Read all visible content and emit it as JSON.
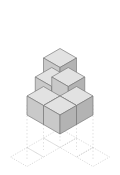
{
  "figure": {
    "title": "Isometric cube stack with projected base grid",
    "type": "isometric-block-diagram",
    "background_color": "#ffffff",
    "canvas": {
      "width": 120,
      "height": 175
    }
  },
  "style": {
    "cube_top_fill": "#e2e2e2",
    "cube_left_fill": "#c9c9c9",
    "cube_right_fill": "#b3b3b3",
    "cube_stroke": "#7a7a7a",
    "cube_stroke_width": 0.7,
    "grid_stroke": "#c0c0c0",
    "grid_stroke_width": 0.6,
    "drop_line_stroke": "#cfcfcf",
    "drop_line_width": 0.6,
    "drop_line_dash": "1.5 2"
  },
  "geometry": {
    "tile_half_width": 16.5,
    "tile_half_height": 9.5,
    "cube_height": 19,
    "origin_x": 60,
    "origin_y": 96,
    "grid_origin_x": 60,
    "grid_origin_y": 150
  },
  "cubes": [
    {
      "id": "cube-front-left",
      "label": "Front left cube",
      "col": -1,
      "row": 0,
      "layer": 0
    },
    {
      "id": "cube-front-center",
      "label": "Front center cube",
      "col": 0,
      "row": 1,
      "layer": 0
    },
    {
      "id": "cube-front-right",
      "label": "Front right cube",
      "col": 1,
      "row": 0,
      "layer": 0
    },
    {
      "id": "cube-mid-left",
      "label": "Middle left cube",
      "col": -0.5,
      "row": 0,
      "layer": 1
    },
    {
      "id": "cube-mid-right",
      "label": "Middle right cube",
      "col": 0.5,
      "row": 0,
      "layer": 1
    },
    {
      "id": "cube-top",
      "label": "Top cube",
      "col": 0,
      "row": 0,
      "layer": 2
    }
  ],
  "cube_count": 6,
  "layers": [
    {
      "name": "Bottom layer",
      "count": 3
    },
    {
      "name": "Middle layer",
      "count": 2
    },
    {
      "name": "Top layer",
      "count": 1
    }
  ],
  "base_grid": {
    "description": "Dotted isometric rhombus grid showing the footprint projection",
    "rhombus_count": 5,
    "cells": [
      {
        "cx": 60,
        "cy": 138
      },
      {
        "cx": 43.5,
        "cy": 147.5
      },
      {
        "cx": 76.5,
        "cy": 147.5
      },
      {
        "cx": 27,
        "cy": 157
      },
      {
        "cx": 93,
        "cy": 157
      }
    ]
  },
  "drop_lines": [
    {
      "x": 27,
      "y1": 105,
      "y2": 160
    },
    {
      "x": 43.5,
      "y1": 114,
      "y2": 150
    },
    {
      "x": 60,
      "y1": 115,
      "y2": 141
    },
    {
      "x": 76.5,
      "y1": 114,
      "y2": 150
    },
    {
      "x": 93,
      "y1": 105,
      "y2": 160
    }
  ]
}
